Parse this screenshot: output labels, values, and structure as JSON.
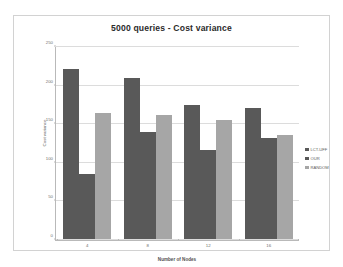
{
  "chart_data": {
    "type": "bar",
    "title": "5000 queries - Cost variance",
    "xlabel": "Number of Nodes",
    "ylabel": "Cost variance",
    "categories": [
      "4",
      "8",
      "12",
      "16"
    ],
    "series": [
      {
        "name": "LCT-UFF",
        "color": "#595959",
        "values": [
          222,
          210,
          174,
          171
        ]
      },
      {
        "name": "OUR",
        "color": "#595959",
        "values": [
          85,
          139,
          116,
          131
        ]
      },
      {
        "name": "RANDOM",
        "color": "#a6a6a6",
        "values": [
          164,
          162,
          155,
          136
        ]
      }
    ],
    "ylim": [
      0,
      250
    ],
    "yticks": [
      0,
      50,
      100,
      150,
      200,
      250
    ],
    "ytick_labels": [
      "0",
      "50",
      "100",
      "150",
      "200",
      "250"
    ],
    "grid": true,
    "legend_position": "right"
  },
  "legend": {
    "items": [
      {
        "label": "LCT-UFF",
        "color": "#595959"
      },
      {
        "label": "OUR",
        "color": "#595959"
      },
      {
        "label": "RANDOM",
        "color": "#a6a6a6"
      }
    ]
  }
}
